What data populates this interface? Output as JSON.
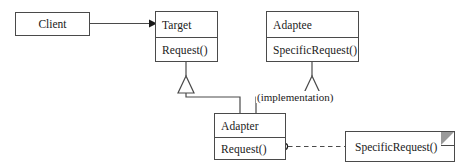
{
  "diagram": {
    "kind": "uml-class-diagram",
    "background_color": "#ffffff",
    "line_color": "#4a4a4a",
    "text_color": "#1a1a1a",
    "note_fold_color": "#9a9a9a"
  },
  "classes": {
    "client": {
      "name": "Client"
    },
    "target": {
      "name": "Target",
      "operations": [
        "Request()"
      ]
    },
    "adaptee": {
      "name": "Adaptee",
      "operations": [
        "SpecificRequest()"
      ]
    },
    "adapter": {
      "name": "Adapter",
      "operations": [
        "Request()"
      ]
    }
  },
  "annotations": {
    "implementation_label": "(implementation)"
  },
  "note": {
    "text": "SpecificRequest()"
  },
  "relationships": [
    {
      "id": "client-uses-target",
      "from": "Client",
      "to": "Target",
      "kind": "association-arrow"
    },
    {
      "id": "adapter-inherits-target",
      "from": "Adapter",
      "to": "Target",
      "kind": "generalization"
    },
    {
      "id": "adapter-inherits-adaptee",
      "from": "Adapter",
      "to": "Adaptee",
      "kind": "generalization"
    },
    {
      "id": "request-calls-specificrequest",
      "from": "Request()",
      "to": "SpecificRequest()",
      "kind": "dashed-note-link"
    }
  ]
}
